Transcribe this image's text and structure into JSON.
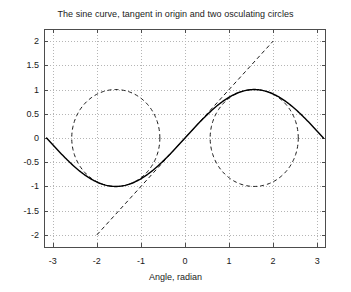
{
  "figure": {
    "width": 351,
    "height": 292,
    "background": "#ffffff",
    "plot_area": {
      "left": 44,
      "top": 29,
      "right": 326,
      "bottom": 247
    }
  },
  "chart_data": {
    "type": "line",
    "title": "The sine curve, tangent in origin and two osculating circles",
    "xlabel": "Angle, radian",
    "ylabel": "",
    "xlim": [
      -3.2,
      3.2
    ],
    "ylim": [
      -2.25,
      2.25
    ],
    "grid": true,
    "grid_style": "dotted",
    "grid_color": "#b5b5b5",
    "legend": "none",
    "xticks": [
      -3,
      -2,
      -1,
      0,
      1,
      2,
      3
    ],
    "xticklabels": [
      "-3",
      "-2",
      "-1",
      "0",
      "1",
      "2",
      "3"
    ],
    "yticks": [
      -2,
      -1.5,
      -1,
      -0.5,
      0,
      0.5,
      1,
      1.5,
      2
    ],
    "yticklabels": [
      "-2",
      "-1.5",
      "-1",
      "-0.5",
      "0",
      "0.5",
      "1",
      "1.5",
      "2"
    ],
    "series": [
      {
        "name": "sine curve",
        "kind": "function",
        "expression": "y = sin(x)",
        "style": "solid",
        "color": "#000000",
        "linewidth": 1.4,
        "x_range": [
          -3.14159,
          3.14159
        ],
        "samples": 241,
        "points": [
          {
            "x": -3.14159,
            "y": 0.0
          },
          {
            "x": -2.74889,
            "y": -0.38268
          },
          {
            "x": -2.35619,
            "y": -0.70711
          },
          {
            "x": -1.9635,
            "y": -0.92388
          },
          {
            "x": -1.5708,
            "y": -1.0
          },
          {
            "x": -1.1781,
            "y": -0.92388
          },
          {
            "x": -0.7854,
            "y": -0.70711
          },
          {
            "x": -0.3927,
            "y": -0.38268
          },
          {
            "x": 0.0,
            "y": 0.0
          },
          {
            "x": 0.3927,
            "y": 0.38268
          },
          {
            "x": 0.7854,
            "y": 0.70711
          },
          {
            "x": 1.1781,
            "y": 0.92388
          },
          {
            "x": 1.5708,
            "y": 1.0
          },
          {
            "x": 1.9635,
            "y": 0.92388
          },
          {
            "x": 2.35619,
            "y": 0.70711
          },
          {
            "x": 2.74889,
            "y": 0.38268
          },
          {
            "x": 3.14159,
            "y": 0.0
          }
        ]
      },
      {
        "name": "tangent in origin",
        "kind": "line",
        "expression": "y = x",
        "style": "dashed",
        "color": "#1a1a1a",
        "linewidth": 1.0,
        "points": [
          {
            "x": -2.0,
            "y": -2.0
          },
          {
            "x": 2.0,
            "y": 2.0
          }
        ]
      },
      {
        "name": "osculating circle at minimum",
        "kind": "circle",
        "style": "dashed",
        "color": "#1a1a1a",
        "linewidth": 1.0,
        "center": {
          "x": -1.5708,
          "y": 0.0
        },
        "radius": 1.0,
        "tangent_point": {
          "x": -1.5708,
          "y": -1.0
        }
      },
      {
        "name": "osculating circle at maximum",
        "kind": "circle",
        "style": "dashed",
        "color": "#1a1a1a",
        "linewidth": 1.0,
        "center": {
          "x": 1.5708,
          "y": 0.0
        },
        "radius": 1.0,
        "tangent_point": {
          "x": 1.5708,
          "y": 1.0
        }
      }
    ]
  }
}
